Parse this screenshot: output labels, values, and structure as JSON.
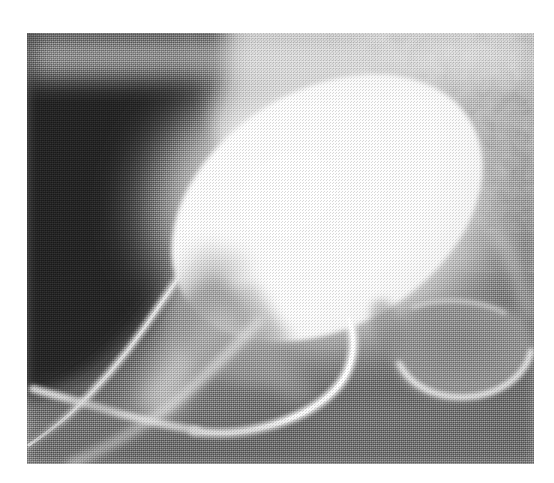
{
  "page": {
    "background_color": "#ffffff",
    "width": 554,
    "height": 483
  },
  "figure": {
    "kind": "radiograph",
    "modality": "X-ray",
    "color_mode": "grayscale",
    "caption": "",
    "alt_text": "Lateral pelvic radiograph showing a large, homogeneously opacified contrast-filled bladder with a thin contrast-filled tract extending inferiorly, overlying pelvic bone.",
    "frame": {
      "left": 27,
      "top": 33,
      "width": 507,
      "height": 431,
      "border": "none"
    },
    "tone": {
      "darkest": "#232323",
      "soft_tissue_dark": "#3a3a3a",
      "mid_gray": "#9a9a9a",
      "bone_light": "#d6d6d6",
      "contrast_white": "#fdfdfd",
      "background_white": "#ffffff"
    },
    "regions": [
      {
        "name": "soft-tissue-shadow-upper-left",
        "description": "Dense dark soft-tissue / off-field shadow occupying the upper-left quadrant",
        "tone": "#2b2b2b"
      },
      {
        "name": "contrast-filled-bladder",
        "description": "Large bright homogeneous oval of radiopaque contrast, tilted about 30 degrees, occupying the upper-right and centre of the field",
        "tone": "#fdfdfd"
      },
      {
        "name": "trabecular-bone-upper-right",
        "description": "Mottled cancellous bone texture at the top-right corner",
        "tone": "#b4b4b4"
      },
      {
        "name": "obturator-foramen-lower-right",
        "description": "Darker rounded lucency ringed by bright cortical bone at the lower right",
        "tone": "#8e8e8e"
      },
      {
        "name": "contrast-tract-inferior",
        "description": "Thin bright contrast-filled tract running from the inferior bladder margin downward and to the left",
        "tone": "#f2f2f2"
      },
      {
        "name": "cortical-bone-lines-lower-left",
        "description": "Pair of bright converging linear cortical bone margins running diagonally to the lower-left corner",
        "tone": "#e8e8e8"
      },
      {
        "name": "pubic-ramus-shadow-centre",
        "description": "Triangular darker wedge of bone and soft tissue below the bladder in the centre of the field",
        "tone": "#9c9c9c"
      }
    ],
    "texture": {
      "name": "halftone-print-grain",
      "description": "Fine halftone dot / screen pattern from a printed reproduction, visible across the whole plate"
    }
  }
}
